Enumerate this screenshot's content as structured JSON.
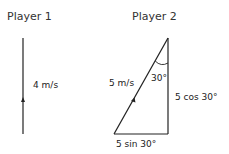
{
  "player1": {
    "title": "Player 1",
    "velocity_label": "4 m/s"
  },
  "player2": {
    "title": "Player 2",
    "hypotenuse_label": "5 m/s",
    "angle_label": "30°",
    "vertical_label": "5 cos 30°",
    "horizontal_label": "5 sin 30°"
  },
  "colors": {
    "line": "#222222",
    "text": "#222222"
  }
}
